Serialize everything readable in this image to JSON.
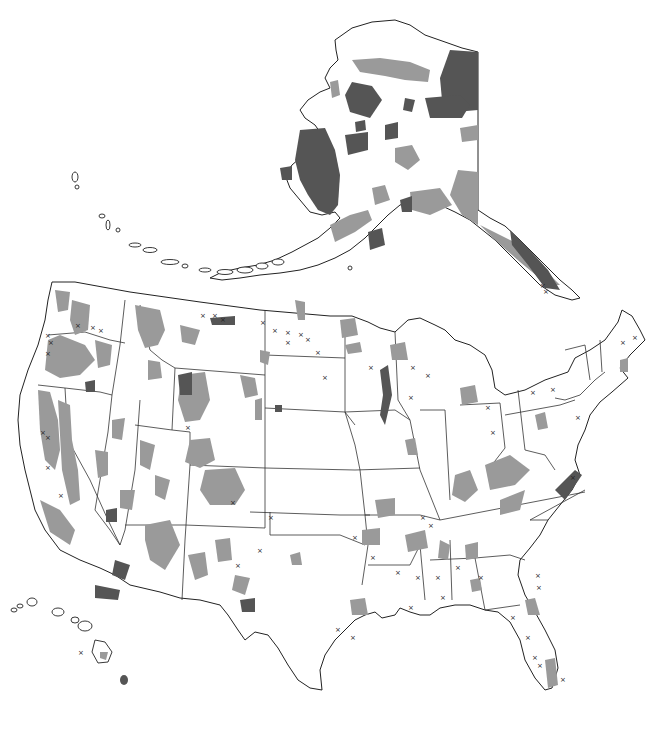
{
  "map": {
    "title": "",
    "regions": [
      "Alaska",
      "Contiguous United States",
      "Hawaii"
    ],
    "colors": {
      "background": "#ffffff",
      "land": "#ffffff",
      "outline": "#222222",
      "category_light": "#9a9a9a",
      "category_dark": "#555555",
      "point_marker": "#222222"
    },
    "symbols": {
      "light_area": "light-gray shaded land area",
      "dark_area": "dark-gray shaded land area",
      "point": "×"
    },
    "legend": null
  }
}
